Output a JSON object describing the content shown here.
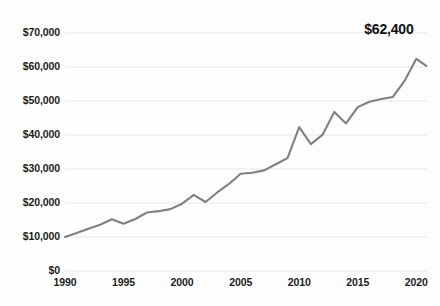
{
  "chart_data": {
    "type": "line",
    "title": "",
    "xlabel": "",
    "ylabel": "",
    "x": [
      1990,
      1991,
      1992,
      1993,
      1994,
      1995,
      1996,
      1997,
      1998,
      1999,
      2000,
      2001,
      2002,
      2003,
      2004,
      2005,
      2006,
      2007,
      2008,
      2009,
      2010,
      2011,
      2012,
      2013,
      2014,
      2015,
      2016,
      2017,
      2018,
      2019,
      2020
    ],
    "values": [
      10000,
      11200,
      12400,
      13600,
      15200,
      13900,
      15300,
      17200,
      17600,
      18200,
      19800,
      22400,
      20300,
      23100,
      25600,
      28600,
      28900,
      29600,
      31400,
      33200,
      42300,
      37300,
      40100,
      46800,
      43400,
      48200,
      49800,
      50600,
      51200,
      55900,
      62400
    ],
    "series": [
      {
        "name": "value",
        "values": [
          10000,
          11200,
          12400,
          13600,
          15200,
          13900,
          15300,
          17200,
          17600,
          18200,
          19800,
          22400,
          20300,
          23100,
          25600,
          28600,
          28900,
          29600,
          31400,
          33200,
          42300,
          37300,
          40100,
          46800,
          43400,
          48200,
          49800,
          50600,
          51200,
          55900,
          62400
        ]
      }
    ],
    "ylim": [
      0,
      73000
    ],
    "xlim": [
      1990,
      2021
    ],
    "ytick_values": [
      0,
      10000,
      20000,
      30000,
      40000,
      50000,
      60000,
      70000
    ],
    "ytick_labels": [
      "$0",
      "$10,000",
      "$20,000",
      "$30,000",
      "$40,000",
      "$50,000",
      "$60,000",
      "$70,000"
    ],
    "xtick_values": [
      1990,
      1995,
      2000,
      2005,
      2010,
      2015,
      2020
    ],
    "xtick_labels": [
      "1990",
      "1995",
      "2000",
      "2005",
      "2010",
      "2015",
      "2020"
    ],
    "grid": "horizontal",
    "legend": "none",
    "annotations": [
      {
        "name": "end-value-label",
        "text": "$62,400",
        "x": 2020,
        "y": 62400
      }
    ],
    "colors": {
      "line": "#808080",
      "grid": "#e8e8e8",
      "background": "#fdfdfd",
      "text": "#1c1c1c",
      "annotation": "#111111"
    }
  }
}
